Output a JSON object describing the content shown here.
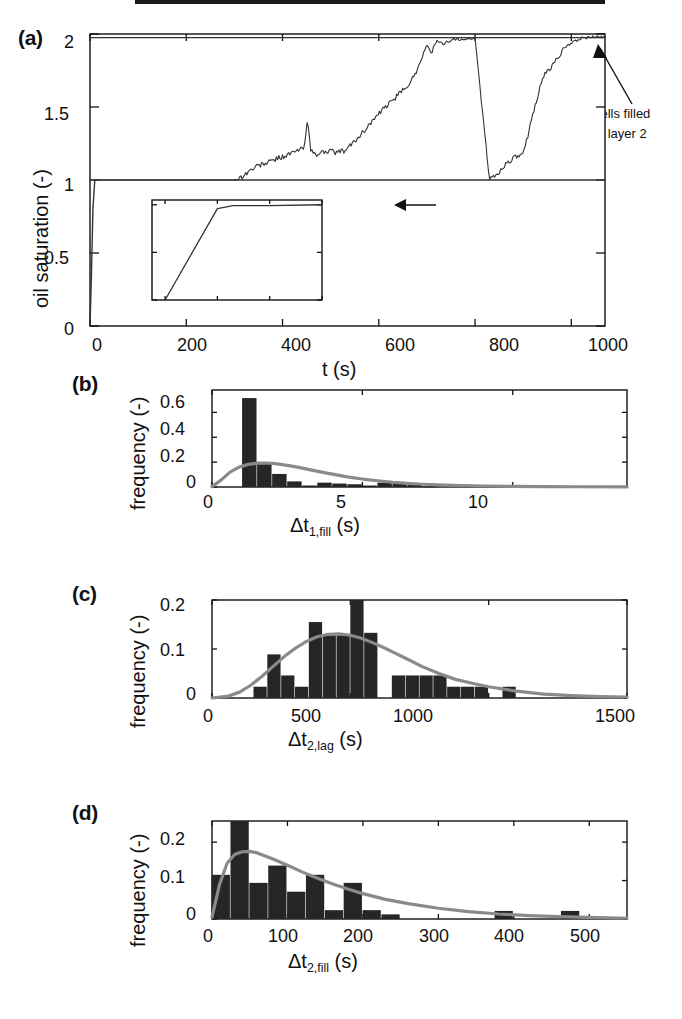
{
  "figure": {
    "panels": [
      "(a)",
      "(b)",
      "(c)",
      "(d)"
    ]
  },
  "panel_a": {
    "label": "(a)",
    "ylabel": "oil saturation (-)",
    "xlabel": "t (s)",
    "yticks": [
      "0",
      "0.5",
      "1",
      "1.5",
      "2"
    ],
    "xticks": [
      "0",
      "200",
      "400",
      "600",
      "800",
      "1000"
    ],
    "annotation_layer2_line1": "cells filled",
    "annotation_layer2_line2": "in layer 2",
    "annotation_layer1": "cells filled in layer 1",
    "inset": {
      "yticks": [
        "0",
        "0.5",
        "1"
      ],
      "xticks": [
        "0",
        "1",
        "2",
        "3"
      ]
    }
  },
  "panel_b": {
    "label": "(b)",
    "ylabel": "frequency (-)",
    "xlabel_base": "Δt",
    "xlabel_sub": "1,fill",
    "xlabel_unit": "(s)",
    "yticks": [
      "0",
      "0.2",
      "0.4",
      "0.6"
    ],
    "xticks": [
      "0",
      "5",
      "10"
    ]
  },
  "panel_c": {
    "label": "(c)",
    "ylabel": "frequency (-)",
    "xlabel_base": "Δt",
    "xlabel_sub": "2,lag",
    "xlabel_unit": "(s)",
    "yticks": [
      "0",
      "0.1",
      "0.2"
    ],
    "xticks": [
      "0",
      "500",
      "1000",
      "1500"
    ]
  },
  "panel_d": {
    "label": "(d)",
    "ylabel": "frequency (-)",
    "xlabel_base": "Δt",
    "xlabel_sub": "2,fill",
    "xlabel_unit": "(s)",
    "yticks": [
      "0",
      "0.1",
      "0.2"
    ],
    "xticks": [
      "0",
      "100",
      "200",
      "300",
      "400",
      "500"
    ]
  },
  "colors": {
    "line": "#333333",
    "bar": "#262626",
    "fit_curve": "#8a8a8a",
    "axis": "#111111"
  },
  "chart_data": [
    {
      "type": "line",
      "panel": "a",
      "title": "",
      "xlabel": "t (s)",
      "ylabel": "oil saturation (-)",
      "xlim": [
        0,
        1070
      ],
      "ylim": [
        0,
        2
      ],
      "xticks": [
        0,
        200,
        400,
        600,
        800,
        1000
      ],
      "yticks": [
        0,
        0.5,
        1,
        1.5,
        2
      ],
      "grid": false,
      "legend": "none",
      "annotations": [
        {
          "text": "cells filled in layer 2",
          "x": 960,
          "y": 1.97
        },
        {
          "text": "cells filled in layer 1",
          "x": 520,
          "y": 0.95
        }
      ],
      "series": [
        {
          "name": "cells filled in layer 1",
          "description": "step rise to saturation 1 near t=0, flat at 1 thereafter",
          "x": [
            0,
            3,
            6,
            10,
            1070
          ],
          "y": [
            0,
            0.35,
            0.8,
            1.0,
            1.0
          ]
        },
        {
          "name": "cells filled in layer 2",
          "description": "noisy staircase from 1 to 2 between t=310 and t=1050",
          "x": [
            0,
            300,
            315,
            330,
            350,
            370,
            390,
            410,
            430,
            445,
            452,
            458,
            470,
            490,
            510,
            530,
            545,
            560,
            580,
            600,
            620,
            640,
            660,
            675,
            690,
            700,
            710,
            720,
            735,
            750,
            800,
            830,
            850,
            860,
            880,
            900,
            920,
            940,
            960,
            980,
            1000,
            1020,
            1050,
            1070
          ],
          "y": [
            1.0,
            1.0,
            1.02,
            1.06,
            1.1,
            1.12,
            1.15,
            1.17,
            1.2,
            1.22,
            1.44,
            1.2,
            1.17,
            1.2,
            1.19,
            1.2,
            1.25,
            1.3,
            1.38,
            1.45,
            1.52,
            1.58,
            1.65,
            1.72,
            1.85,
            1.92,
            1.88,
            1.95,
            1.93,
            1.96,
            1.97,
            1.0,
            1.05,
            1.1,
            1.15,
            1.17,
            1.45,
            1.7,
            1.78,
            1.88,
            1.94,
            1.97,
            1.98,
            1.98
          ]
        }
      ],
      "inset": {
        "type": "line",
        "xlim": [
          -0.25,
          3
        ],
        "ylim": [
          0,
          1.05
        ],
        "xticks": [
          0,
          1,
          2,
          3
        ],
        "yticks": [
          0,
          0.5,
          1
        ],
        "x": [
          0,
          1,
          1.3,
          2,
          3
        ],
        "y": [
          0,
          0.96,
          0.99,
          0.99,
          1.0
        ]
      }
    },
    {
      "type": "bar",
      "panel": "b",
      "title": "",
      "xlabel": "Δt1,fill (s)",
      "ylabel": "frequency (-)",
      "xlim": [
        0,
        13.8
      ],
      "ylim": [
        0,
        0.78
      ],
      "xticks": [
        0,
        5,
        10
      ],
      "yticks": [
        0,
        0.2,
        0.4,
        0.6
      ],
      "grid": false,
      "bin_width": 0.5,
      "bin_centers": [
        1.25,
        1.75,
        2.25,
        2.75,
        3.25,
        3.75,
        4.25,
        4.75,
        5.25,
        5.75,
        6.25,
        6.75,
        7.25
      ],
      "values": [
        0.715,
        0.195,
        0.105,
        0.045,
        0.012,
        0.035,
        0.028,
        0.022,
        0.012,
        0.035,
        0.035,
        0.018,
        0.004
      ],
      "fit_curve": {
        "name": "lognormal fit",
        "x": [
          0.0,
          0.3,
          0.6,
          0.9,
          1.2,
          1.5,
          1.8,
          2.1,
          2.4,
          2.8,
          3.2,
          3.6,
          4.0,
          4.5,
          5.0,
          5.5,
          6.0,
          6.5,
          7.0,
          8.0,
          9.0,
          10.0,
          11.0,
          12.0,
          13.8
        ],
        "y": [
          0.003,
          0.055,
          0.12,
          0.16,
          0.182,
          0.192,
          0.193,
          0.188,
          0.178,
          0.162,
          0.142,
          0.122,
          0.103,
          0.082,
          0.064,
          0.05,
          0.038,
          0.029,
          0.022,
          0.013,
          0.008,
          0.005,
          0.003,
          0.002,
          0.001
        ]
      }
    },
    {
      "type": "bar",
      "panel": "c",
      "title": "",
      "xlabel": "Δt2,lag (s)",
      "ylabel": "frequency (-)",
      "xlim": [
        0,
        1500
      ],
      "ylim": [
        0,
        0.2
      ],
      "xticks": [
        0,
        500,
        1000,
        1500
      ],
      "yticks": [
        0,
        0.1,
        0.2
      ],
      "grid": false,
      "bin_width": 50,
      "bin_centers": [
        175,
        225,
        275,
        325,
        375,
        425,
        475,
        525,
        575,
        675,
        725,
        775,
        825,
        875,
        925,
        975,
        1075
      ],
      "values": [
        0.023,
        0.089,
        0.046,
        0.023,
        0.155,
        0.128,
        0.128,
        0.205,
        0.133,
        0.046,
        0.046,
        0.046,
        0.046,
        0.023,
        0.023,
        0.023,
        0.023
      ],
      "fit_curve": {
        "name": "lognormal fit",
        "x": [
          0,
          60,
          100,
          140,
          180,
          220,
          260,
          300,
          340,
          380,
          420,
          460,
          500,
          540,
          580,
          620,
          660,
          700,
          760,
          820,
          880,
          940,
          1000,
          1100,
          1200,
          1300,
          1400,
          1500
        ],
        "y": [
          0.0,
          0.004,
          0.012,
          0.026,
          0.044,
          0.064,
          0.084,
          0.101,
          0.115,
          0.125,
          0.13,
          0.131,
          0.128,
          0.122,
          0.113,
          0.103,
          0.092,
          0.081,
          0.064,
          0.05,
          0.038,
          0.03,
          0.023,
          0.014,
          0.008,
          0.005,
          0.003,
          0.002
        ]
      }
    },
    {
      "type": "bar",
      "panel": "d",
      "title": "",
      "xlabel": "Δt2,fill (s)",
      "ylabel": "frequency (-)",
      "xlim": [
        0,
        550
      ],
      "ylim": [
        0,
        0.255
      ],
      "xticks": [
        0,
        100,
        200,
        300,
        400,
        500
      ],
      "yticks": [
        0,
        0.1,
        0.2
      ],
      "grid": false,
      "bin_width": 25,
      "bin_centers": [
        12,
        37,
        62,
        87,
        112,
        137,
        162,
        187,
        212,
        237,
        262,
        287,
        387,
        475
      ],
      "values": [
        0.115,
        0.255,
        0.094,
        0.139,
        0.071,
        0.115,
        0.023,
        0.094,
        0.023,
        0.012,
        0.0,
        0.0,
        0.021,
        0.021
      ],
      "fit_curve": {
        "name": "lognormal fit",
        "x": [
          0,
          10,
          20,
          30,
          40,
          50,
          60,
          80,
          100,
          120,
          140,
          160,
          180,
          200,
          230,
          260,
          300,
          340,
          380,
          420,
          460,
          500,
          550
        ],
        "y": [
          0.005,
          0.09,
          0.145,
          0.168,
          0.175,
          0.176,
          0.172,
          0.157,
          0.14,
          0.122,
          0.106,
          0.091,
          0.078,
          0.066,
          0.051,
          0.04,
          0.028,
          0.019,
          0.013,
          0.009,
          0.006,
          0.004,
          0.002
        ]
      }
    }
  ]
}
